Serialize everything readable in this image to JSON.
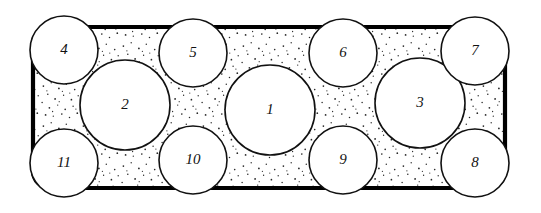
{
  "figure": {
    "background_color": "#ffffff",
    "line_color": "#111111",
    "container_stroke_color": "#000000",
    "stipple_color": "#2a2a2a",
    "container": {
      "name": "rounded-rectangle-boundary",
      "x": 33,
      "y": 27,
      "width": 472,
      "height": 161,
      "corner_radius": 17,
      "stroke_width": 4.2
    },
    "circles": [
      {
        "label": "1",
        "cx": 270,
        "cy": 110,
        "r": 45,
        "size": "large"
      },
      {
        "label": "2",
        "cx": 125,
        "cy": 105,
        "r": 45,
        "size": "large"
      },
      {
        "label": "3",
        "cx": 420,
        "cy": 103,
        "r": 45,
        "size": "large"
      },
      {
        "label": "4",
        "cx": 64,
        "cy": 50,
        "r": 34,
        "size": "small"
      },
      {
        "label": "5",
        "cx": 193,
        "cy": 53,
        "r": 34,
        "size": "small"
      },
      {
        "label": "6",
        "cx": 343,
        "cy": 53,
        "r": 34,
        "size": "small"
      },
      {
        "label": "7",
        "cx": 475,
        "cy": 51,
        "r": 34,
        "size": "small"
      },
      {
        "label": "8",
        "cx": 475,
        "cy": 163,
        "r": 34,
        "size": "small"
      },
      {
        "label": "9",
        "cx": 343,
        "cy": 160,
        "r": 34,
        "size": "small"
      },
      {
        "label": "10",
        "cx": 193,
        "cy": 160,
        "r": 34,
        "size": "small"
      },
      {
        "label": "11",
        "cx": 64,
        "cy": 163,
        "r": 34,
        "size": "small"
      }
    ]
  }
}
